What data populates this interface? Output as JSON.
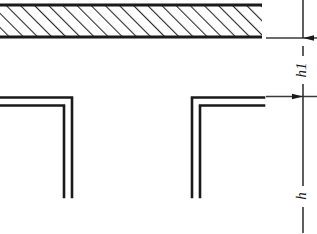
{
  "drawing": {
    "title": "Angle profile clearance detail",
    "background_color": "#ffffff",
    "line_color": "#1a1a1a",
    "hatch_color": "#2b2b2b",
    "dimension_color": "#3a3a3a",
    "slab": {
      "name": "hatched-slab",
      "description": "Hatched structural band (section cut)",
      "x": 0,
      "y": 4,
      "width": 262,
      "height": 34,
      "hatch_angle_deg": 45,
      "hatch_spacing_px": 10
    },
    "profiles": [
      {
        "name": "left-angle-profile",
        "orientation": "top-right-corner",
        "corner_x": 72,
        "top_y": 97,
        "bottom_y": 197,
        "left_x": 0,
        "thickness": 8
      },
      {
        "name": "right-angle-profile",
        "orientation": "top-left-corner",
        "corner_x": 192,
        "top_y": 97,
        "bottom_y": 197,
        "right_x": 262,
        "thickness": 8
      }
    ],
    "dimensions": [
      {
        "name": "dimension-h1",
        "label": "h1",
        "label_rotation_deg": -90,
        "line_x": 303,
        "from_y": 4,
        "to_y": 96,
        "extension_line_y": 38,
        "extension_line_x_start": 266,
        "extension_line_x_end": 317,
        "arrow_direction": "down"
      },
      {
        "name": "dimension-h",
        "label": "h",
        "label_rotation_deg": -90,
        "line_x": 303,
        "from_y": 96,
        "to_y": 233,
        "extension_line_y": 96,
        "extension_line_x_start": 266,
        "extension_line_x_end": 317,
        "arrow_direction": "up"
      }
    ]
  }
}
